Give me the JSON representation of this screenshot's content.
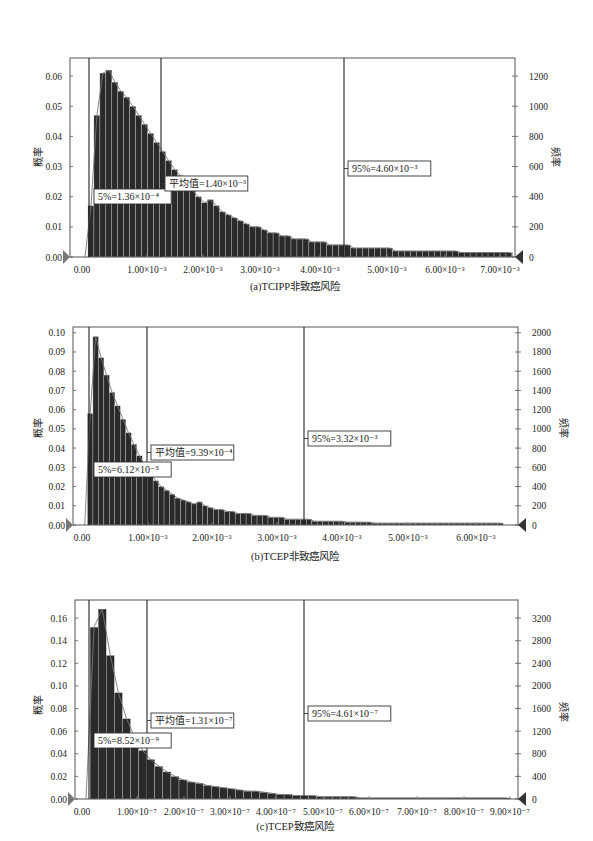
{
  "chart_data": [
    {
      "type": "bar",
      "title": "(a)TCIPP非致癌风险",
      "caption": "(a)TCIPP非致癌风险",
      "xlabel": "",
      "ylabel": "概率",
      "ylabel_right": "频率",
      "xlim": [
        0,
        0.0075
      ],
      "ylim": [
        0,
        0.066
      ],
      "ylim_right": [
        0,
        1320
      ],
      "x_ticks": [
        "0.00",
        "1.00×10⁻³",
        "2.00×10⁻³",
        "3.00×10⁻³",
        "4.00×10⁻³",
        "5.00×10⁻³",
        "6.00×10⁻³",
        "7.00×10⁻³"
      ],
      "y_ticks": [
        "0.00",
        "0.01",
        "0.02",
        "0.03",
        "0.04",
        "0.05",
        "0.06"
      ],
      "y_ticks_right": [
        "0",
        "200",
        "400",
        "600",
        "800",
        "1000",
        "1200"
      ],
      "grid": false,
      "series": [
        {
          "name": "histogram",
          "bin_width": 0.0001,
          "x_start": 0.0,
          "values": [
            0.0,
            0.017,
            0.047,
            0.061,
            0.062,
            0.058,
            0.055,
            0.053,
            0.05,
            0.047,
            0.044,
            0.041,
            0.038,
            0.035,
            0.032,
            0.029,
            0.027,
            0.024,
            0.022,
            0.02,
            0.018,
            0.019,
            0.017,
            0.015,
            0.014,
            0.013,
            0.012,
            0.011,
            0.01,
            0.01,
            0.009,
            0.008,
            0.008,
            0.007,
            0.007,
            0.006,
            0.006,
            0.006,
            0.005,
            0.005,
            0.005,
            0.004,
            0.004,
            0.004,
            0.004,
            0.003,
            0.003,
            0.003,
            0.003,
            0.003,
            0.003,
            0.003,
            0.002,
            0.002,
            0.002,
            0.002,
            0.002,
            0.002,
            0.002,
            0.002,
            0.002,
            0.002,
            0.002,
            0.0015,
            0.0015,
            0.0015,
            0.0015,
            0.0015,
            0.0015,
            0.0015,
            0.0015,
            0.0015,
            0.0015,
            0.0015
          ]
        }
      ],
      "markers": [
        {
          "label": "5%=1.36×10⁻⁴",
          "x": 0.000136
        },
        {
          "label": "平均值=1.40×10⁻³",
          "x": 0.0014
        },
        {
          "label": "95%=4.60×10⁻³",
          "x": 0.0046
        }
      ]
    },
    {
      "type": "bar",
      "title": "(b)TCEP非致癌风险",
      "caption": "(b)TCEP非致癌风险",
      "xlabel": "",
      "ylabel": "概率",
      "ylabel_right": "频率",
      "xlim": [
        0,
        0.0065
      ],
      "ylim": [
        0,
        0.103
      ],
      "ylim_right": [
        0,
        2060
      ],
      "x_ticks": [
        "0.00",
        "1.00×10⁻³",
        "2.00×10⁻³",
        "3.00×10⁻³",
        "4.00×10⁻³",
        "5.00×10⁻³",
        "6.00×10⁻³"
      ],
      "y_ticks": [
        "0.00",
        "0.01",
        "0.02",
        "0.03",
        "0.04",
        "0.05",
        "0.06",
        "0.07",
        "0.08",
        "0.09",
        "0.10"
      ],
      "y_ticks_right": [
        "0",
        "200",
        "400",
        "600",
        "800",
        "1000",
        "1200",
        "1400",
        "1600",
        "1800",
        "2000"
      ],
      "grid": false,
      "series": [
        {
          "name": "histogram",
          "bin_width": 8.33e-05,
          "x_start": 0.0,
          "values": [
            0.0,
            0.058,
            0.098,
            0.087,
            0.078,
            0.069,
            0.062,
            0.055,
            0.048,
            0.042,
            0.036,
            0.031,
            0.027,
            0.023,
            0.02,
            0.018,
            0.016,
            0.014,
            0.013,
            0.012,
            0.011,
            0.012,
            0.01,
            0.009,
            0.008,
            0.008,
            0.007,
            0.007,
            0.006,
            0.006,
            0.006,
            0.005,
            0.005,
            0.005,
            0.004,
            0.004,
            0.004,
            0.003,
            0.003,
            0.003,
            0.003,
            0.003,
            0.002,
            0.002,
            0.002,
            0.002,
            0.002,
            0.002,
            0.0015,
            0.0015,
            0.0015,
            0.0015,
            0.0015,
            0.001,
            0.001,
            0.001,
            0.001,
            0.001,
            0.001,
            0.001,
            0.001,
            0.001,
            0.001,
            0.001,
            0.001,
            0.001,
            0.001,
            0.001,
            0.001,
            0.001,
            0.001,
            0.001,
            0.001,
            0.001,
            0.001,
            0.001,
            0.001
          ]
        }
      ],
      "markers": [
        {
          "label": "5%=6.12×10⁻⁵",
          "x": 6.12e-05
        },
        {
          "label": "平均值=9.39×10⁻⁴",
          "x": 0.000939
        },
        {
          "label": "95%=3.32×10⁻³",
          "x": 0.00332
        }
      ]
    },
    {
      "type": "bar",
      "title": "(c)TCEP致癌风险",
      "caption": "(c)TCEP致癌风险",
      "xlabel": "",
      "ylabel": "概率",
      "ylabel_right": "频率",
      "xlim": [
        0,
        9e-07
      ],
      "ylim": [
        0,
        0.176
      ],
      "ylim_right": [
        0,
        3520
      ],
      "x_ticks": [
        "0.00",
        "1.00×10⁻⁷",
        "2.00×10⁻⁷",
        "3.00×10⁻⁷",
        "4.00×10⁻⁷",
        "5.00×10⁻⁷",
        "6.00×10⁻⁷",
        "7.00×10⁻⁷",
        "8.00×10⁻⁷",
        "9.00×10⁻⁷"
      ],
      "y_ticks": [
        "0.00",
        "0.02",
        "0.04",
        "0.06",
        "0.08",
        "0.10",
        "0.12",
        "0.14",
        "0.16"
      ],
      "y_ticks_right": [
        "0",
        "400",
        "800",
        "1200",
        "1600",
        "2000",
        "2400",
        "2800",
        "3200"
      ],
      "grid": false,
      "series": [
        {
          "name": "histogram",
          "bin_width": 1.7e-08,
          "x_start": 0.0,
          "values": [
            0.0,
            0.152,
            0.168,
            0.127,
            0.094,
            0.071,
            0.055,
            0.043,
            0.035,
            0.029,
            0.024,
            0.02,
            0.017,
            0.015,
            0.014,
            0.012,
            0.011,
            0.01,
            0.009,
            0.008,
            0.007,
            0.007,
            0.006,
            0.005,
            0.004,
            0.004,
            0.003,
            0.003,
            0.003,
            0.002,
            0.002,
            0.002,
            0.002,
            0.002,
            0.001,
            0.001,
            0.001,
            0.001,
            0.001,
            0.001,
            0.001,
            0.001,
            0.001,
            0.001,
            0.001,
            0.001,
            0.001,
            0.001,
            0.001,
            0.001,
            0.001,
            0.001,
            0.001
          ]
        }
      ],
      "markers": [
        {
          "label": "5%=8.52×10⁻⁹",
          "x": 8.52e-09
        },
        {
          "label": "平均值=1.31×10⁻⁷",
          "x": 1.31e-07
        },
        {
          "label": "95%=4.61×10⁻⁷",
          "x": 4.61e-07
        }
      ]
    }
  ],
  "panels": [
    {
      "caption": "(a)TCIPP非致癌风险",
      "ylabel": "概率",
      "ylabel_right": "频率",
      "ann_p5": "5%=1.36×10⁻⁴",
      "ann_mean": "平均值=1.40×10⁻³",
      "ann_p95": "95%=4.60×10⁻³"
    },
    {
      "caption": "(b)TCEP非致癌风险",
      "ylabel": "概率",
      "ylabel_right": "频率",
      "ann_p5": "5%=6.12×10⁻⁵",
      "ann_mean": "平均值=9.39×10⁻⁴",
      "ann_p95": "95%=3.32×10⁻³"
    },
    {
      "caption": "(c)TCEP致癌风险",
      "ylabel": "概率",
      "ylabel_right": "频率",
      "ann_p5": "5%=8.52×10⁻⁹",
      "ann_mean": "平均值=1.31×10⁻⁷",
      "ann_p95": "95%=4.61×10⁻⁷"
    }
  ]
}
